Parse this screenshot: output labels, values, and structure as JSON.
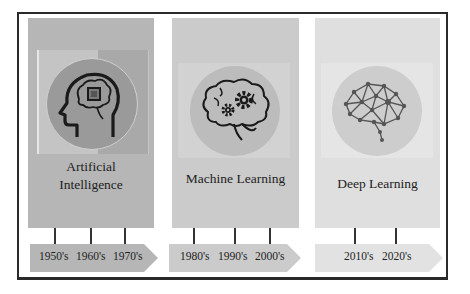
{
  "colors": {
    "panel_ai": "#b6b6b6",
    "panel_ml": "#cbcbcb",
    "panel_dl": "#dfdfdf",
    "circle_ai": "#9a9a9a",
    "circle_ml": "#bcbcbc",
    "circle_dl": "#cdcdcd",
    "border": "#2a2a2a"
  },
  "eras": [
    {
      "title_line1": "Artificial",
      "title_line2": "Intelligence",
      "icon": "head-chip-brain-icon",
      "decades": [
        "1950's",
        "1960's",
        "1970's"
      ]
    },
    {
      "title_line1": "Machine Learning",
      "icon": "brain-gears-icon",
      "decades": [
        "1980's",
        "1990's",
        "2000's"
      ]
    },
    {
      "title_line1": "Deep Learning",
      "icon": "neural-network-brain-icon",
      "decades": [
        "2010's",
        "2020's"
      ]
    }
  ]
}
